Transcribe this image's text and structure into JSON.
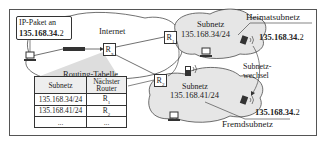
{
  "packet": {
    "line1": "IP-Paket an",
    "addr_bold": "135.168.34.",
    "addr_tail": "2"
  },
  "internet_label": "Internet",
  "routers": {
    "rx": "R",
    "rx_sub": "x",
    "r1": "R",
    "r1_sub": "1",
    "r2": "R",
    "r2_sub": "2"
  },
  "home_subnet": {
    "title": "Subnetz",
    "prefix": "135.168.34/24",
    "label": "Heimatsubnetz",
    "host_bold": "135.168.34.",
    "host_tail": "2"
  },
  "foreign_subnet": {
    "title": "Subnetz",
    "prefix": "135.168.41/24",
    "label": "Fremdsubnetz",
    "host_bold": "135.168.34.",
    "host_tail": "2"
  },
  "move_label": {
    "line1": "Subnetz-",
    "line2": "wechsel"
  },
  "routing_table": {
    "title": "Routing-Tabelle",
    "headers": [
      "Subnetz",
      "Nächster",
      "Router"
    ],
    "rows": [
      {
        "subnet": "135.168.34/24",
        "router": "R",
        "router_sub": "1"
      },
      {
        "subnet": "135.168.41/24",
        "router": "R",
        "router_sub": "2"
      },
      {
        "subnet": "...",
        "router": "..."
      }
    ]
  },
  "colors": {
    "cloud_fill": "#e6e6e6",
    "line": "#333333",
    "packet_bar": "#333333"
  }
}
